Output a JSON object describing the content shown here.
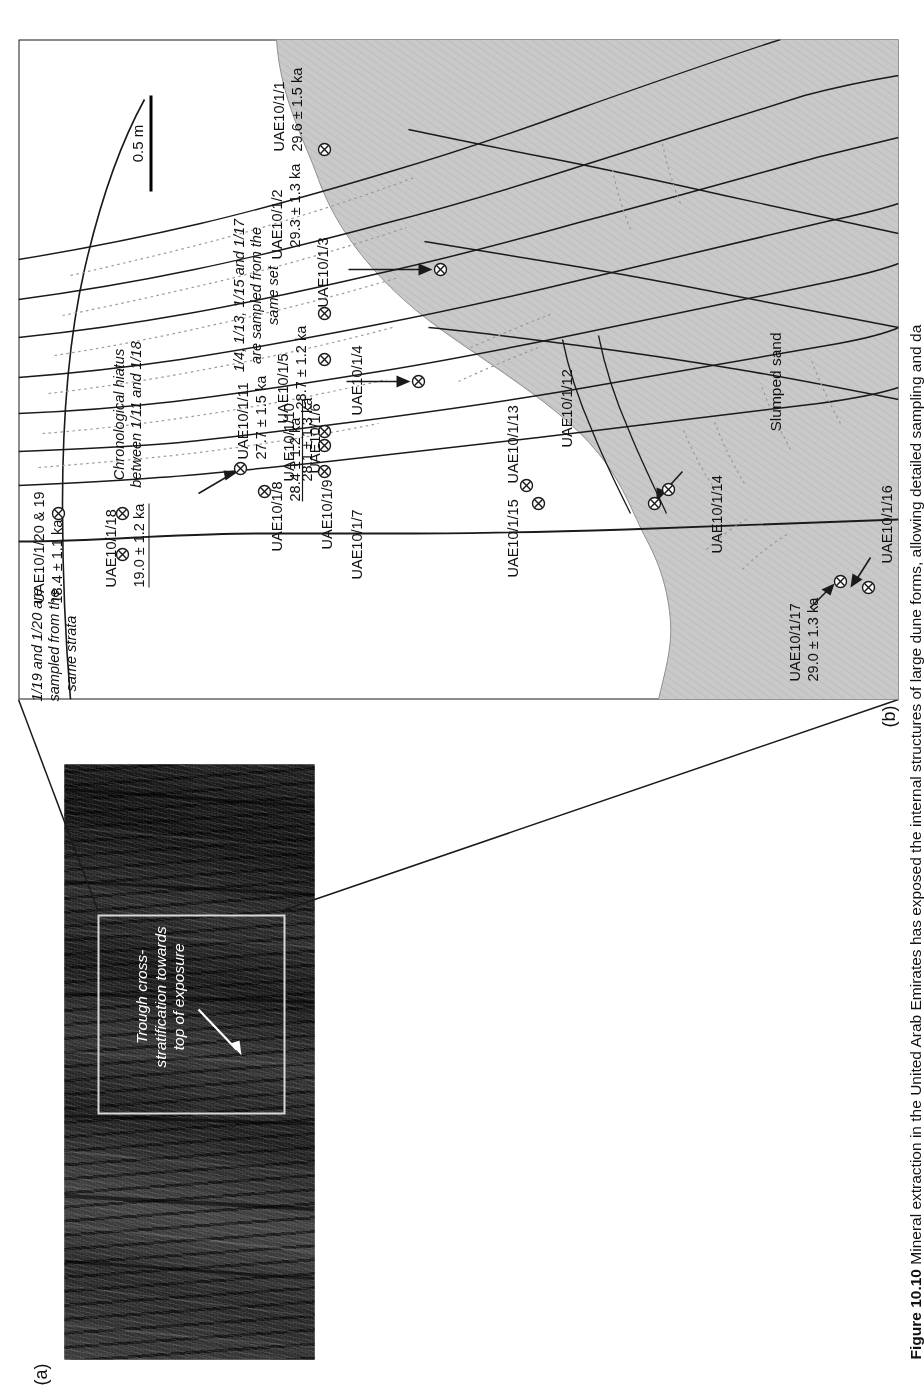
{
  "figure": {
    "panel_a_letter": "(a)",
    "panel_b_letter": "(b)",
    "caption_label": "Figure 10.10",
    "caption_text": "Mineral extraction in the United Arab Emirates has exposed the internal structures of large dune forms, allowing detailed sampling and da"
  },
  "photo": {
    "annotation_line1": "Trough cross-",
    "annotation_line2": "stratification towards",
    "annotation_line3": "top of exposure"
  },
  "section": {
    "scale_bar_label": "0.5 m",
    "slumped_sand_label": "Slumped sand",
    "notes": [
      {
        "id": "note-same-strata",
        "line1": "1/19 and 1/20 are",
        "line2": "sampled from the",
        "line3": "same strata"
      },
      {
        "id": "note-hiatus",
        "line1": "Chronological hiatus",
        "line2": "between 1/11 and 1/18"
      },
      {
        "id": "note-same-set",
        "line1": "1/4, 1/13, 1/15 and 1/17",
        "line2": "are sampled from the",
        "line3": "same set"
      }
    ],
    "samples": [
      {
        "id": "s20_19",
        "name": "UAE10/1/20 & 19",
        "age": "18.4 ± 1.1 ka"
      },
      {
        "id": "s18",
        "name": "UAE10/1/18",
        "age": "19.0 ± 1.2 ka"
      },
      {
        "id": "s11",
        "name": "UAE10/1/11",
        "age": "27.7 ± 1.5 ka"
      },
      {
        "id": "s10",
        "name": "UAE10/1/10",
        "age": "28.1 ± 1.3 ka"
      },
      {
        "id": "s9",
        "name": "UAE10/1/9",
        "age": ""
      },
      {
        "id": "s8",
        "name": "UAE10/1/8",
        "age": "28.4 ± 1.2 ka"
      },
      {
        "id": "s7",
        "name": "UAE10/1/7",
        "age": ""
      },
      {
        "id": "s6",
        "name": "UAE10/1/6",
        "age": ""
      },
      {
        "id": "s5",
        "name": "UAE10/1/5",
        "age": "28.7 ± 1.2 ka"
      },
      {
        "id": "s4",
        "name": "UAE10/1/4",
        "age": ""
      },
      {
        "id": "s3",
        "name": "UAE10/1/3",
        "age": ""
      },
      {
        "id": "s2",
        "name": "UAE10/1/2",
        "age": "29.3 ± 1.3 ka"
      },
      {
        "id": "s1",
        "name": "UAE10/1/1",
        "age": "29.6 ± 1.5 ka"
      },
      {
        "id": "s17",
        "name": "UAE10/1/17",
        "age": "29.0 ± 1.3 ka"
      },
      {
        "id": "s16",
        "name": "UAE10/1/16",
        "age": ""
      },
      {
        "id": "s15",
        "name": "UAE10/1/15",
        "age": ""
      },
      {
        "id": "s14",
        "name": "UAE10/1/14",
        "age": ""
      },
      {
        "id": "s13",
        "name": "UAE10/1/13",
        "age": ""
      },
      {
        "id": "s12",
        "name": "UAE10/1/12",
        "age": ""
      }
    ]
  },
  "colors": {
    "slumped_sand_fill": "#c9c9c9",
    "line": "#1a1a1a",
    "dotted_line": "#8c8c8c",
    "photo_dark": "#141414",
    "inset_box": "#d9d9d9"
  }
}
